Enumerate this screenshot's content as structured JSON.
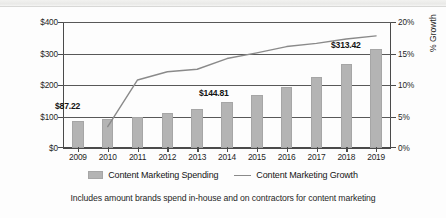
{
  "chart_data": {
    "type": "bar",
    "title": "",
    "subtitle": "",
    "categories": [
      "2009",
      "2010",
      "2011",
      "2012",
      "2013",
      "2014",
      "2015",
      "2016",
      "2017",
      "2018",
      "2019"
    ],
    "series": [
      {
        "name": "Content Marketing Spending",
        "type": "bar",
        "axis": "left",
        "unit": "US$ Billions",
        "color": "#b4b4b4",
        "values": [
          87.22,
          92.0,
          100.0,
          110.0,
          124.0,
          144.81,
          168.0,
          193.0,
          227.0,
          268.0,
          313.42
        ]
      },
      {
        "name": "Content Marketing Growth",
        "type": "line",
        "axis": "right",
        "unit": "% Growth",
        "color": "#8a8a8a",
        "values": [
          null,
          3.4,
          10.8,
          12.1,
          12.5,
          14.2,
          15.1,
          16.1,
          16.6,
          17.3,
          17.8
        ]
      }
    ],
    "data_labels": [
      {
        "category": "2009",
        "text": "$87.22"
      },
      {
        "category": "2014",
        "text": "$144.81"
      },
      {
        "category": "2019",
        "text": "$313.42"
      }
    ],
    "xlabel": "",
    "ylabel": "US$ Billions",
    "y2label": "% Growth",
    "ylim": [
      0,
      400
    ],
    "y2lim": [
      0,
      20
    ],
    "yticks": [
      "$0",
      "$100",
      "$200",
      "$300",
      "$400"
    ],
    "ytick_values": [
      0,
      100,
      200,
      300,
      400
    ],
    "y2ticks": [
      "0%",
      "5%",
      "10%",
      "15%",
      "20%"
    ],
    "y2tick_values": [
      0,
      5,
      10,
      15,
      20
    ],
    "grid": true,
    "grid_axis": "y",
    "legend_position": "bottom",
    "annotation": "Includes amount brands spend in-house and on contractors for content marketing"
  },
  "axes": {
    "left_title": "US$ Billions",
    "right_title": "% Growth",
    "left_ticks": [
      "$400",
      "$300",
      "$200",
      "$100",
      "$0"
    ],
    "right_ticks": [
      "20%",
      "15%",
      "10%",
      "5%",
      "0%"
    ],
    "x_ticks": [
      "2009",
      "2010",
      "2011",
      "2012",
      "2013",
      "2014",
      "2015",
      "2016",
      "2017",
      "2018",
      "2019"
    ]
  },
  "callouts": {
    "first": "$87.22",
    "middle": "$144.81",
    "last": "$313.42"
  },
  "legend": {
    "items": [
      {
        "label": "Content Marketing Spending",
        "marker": "bar-swatch",
        "color": "#b4b4b4"
      },
      {
        "label": "Content Marketing Growth",
        "marker": "line-swatch",
        "color": "#8a8a8a"
      }
    ]
  },
  "caption": {
    "text": "Includes amount brands spend in-house and on contractors for content marketing"
  }
}
